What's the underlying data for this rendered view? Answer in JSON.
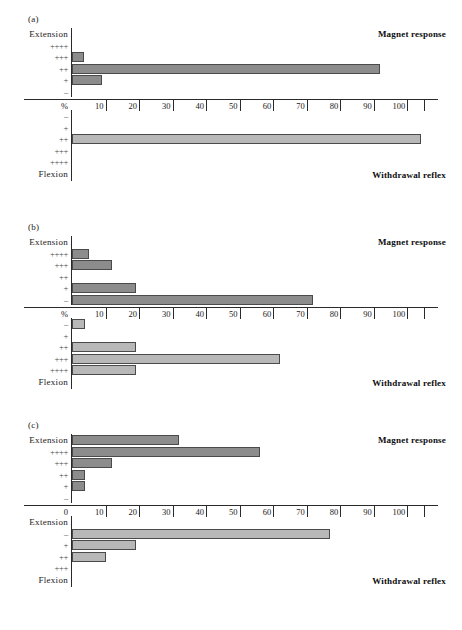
{
  "figure": {
    "panels": [
      {
        "tag": "(a)",
        "magnet_title": "Magnet response",
        "withdrawal_title": "Withdrawal reflex",
        "origin_label": "%",
        "upper_labels": [
          "Extension",
          "++++",
          "+++",
          "++",
          "+",
          "–"
        ],
        "lower_labels": [
          "–",
          "+",
          "++",
          "+++",
          "++++",
          "Flexion"
        ],
        "magnet_values": [
          0,
          0,
          3.5,
          92,
          9,
          0
        ],
        "withdrawal_values": [
          0,
          0,
          104,
          0,
          0,
          0
        ]
      },
      {
        "tag": "(b)",
        "magnet_title": "Magnet response",
        "withdrawal_title": "Withdrawal reflex",
        "origin_label": "%",
        "upper_labels": [
          "Extension",
          "++++",
          "+++",
          "++",
          "+",
          "–"
        ],
        "lower_labels": [
          "–",
          "+",
          "++",
          "+++",
          "++++",
          "Flexion"
        ],
        "magnet_values": [
          0,
          5,
          12,
          0,
          19,
          72
        ],
        "withdrawal_values": [
          4,
          0,
          19,
          62,
          19,
          0
        ]
      },
      {
        "tag": "(c)",
        "magnet_title": "Magnet response",
        "withdrawal_title": "Withdrawal reflex",
        "origin_label": "0",
        "upper_labels": [
          "Extension",
          "++++",
          "+++",
          "++",
          "+",
          "–"
        ],
        "lower_labels": [
          "Extension",
          "–",
          "+",
          "++",
          "+++",
          "Flexion"
        ],
        "magnet_values": [
          32,
          56,
          12,
          4,
          4,
          0
        ],
        "withdrawal_values": [
          0,
          77,
          19,
          10,
          0,
          0
        ]
      }
    ],
    "axis": {
      "ticks": [
        10,
        20,
        30,
        40,
        50,
        60,
        70,
        80,
        90,
        100
      ],
      "min": 0,
      "max": 105
    },
    "colors": {
      "magnet_bar": "#8c8c8c",
      "withdrawal_bar": "#b8b8b8",
      "axis": "#2a2a2a"
    }
  },
  "chart_data": {
    "type": "bar",
    "xlabel": "%",
    "ylabel": "",
    "xlim": [
      0,
      105
    ],
    "grid": false,
    "legend": "none",
    "orientation": "horizontal",
    "panels": [
      {
        "panel": "(a)",
        "magnet_response": {
          "categories": [
            "Extension",
            "++++",
            "+++",
            "++",
            "+",
            "–"
          ],
          "values": [
            0,
            0,
            3.5,
            92,
            9,
            0
          ]
        },
        "withdrawal_reflex": {
          "categories": [
            "–",
            "+",
            "++",
            "+++",
            "++++",
            "Flexion"
          ],
          "values": [
            0,
            0,
            104,
            0,
            0,
            0
          ]
        }
      },
      {
        "panel": "(b)",
        "magnet_response": {
          "categories": [
            "Extension",
            "++++",
            "+++",
            "++",
            "+",
            "–"
          ],
          "values": [
            0,
            5,
            12,
            0,
            19,
            72
          ]
        },
        "withdrawal_reflex": {
          "categories": [
            "–",
            "+",
            "++",
            "+++",
            "++++",
            "Flexion"
          ],
          "values": [
            4,
            0,
            19,
            62,
            19,
            0
          ]
        }
      },
      {
        "panel": "(c)",
        "magnet_response": {
          "categories": [
            "Extension",
            "++++",
            "+++",
            "++",
            "+",
            "–"
          ],
          "values": [
            32,
            56,
            12,
            4,
            4,
            0
          ]
        },
        "withdrawal_reflex": {
          "categories": [
            "Extension",
            "–",
            "+",
            "++",
            "+++",
            "Flexion"
          ],
          "values": [
            0,
            77,
            19,
            10,
            0,
            0
          ]
        }
      }
    ],
    "xticks": [
      10,
      20,
      30,
      40,
      50,
      60,
      70,
      80,
      90,
      100
    ]
  }
}
